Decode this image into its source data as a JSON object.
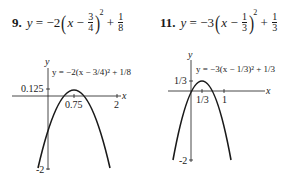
{
  "problems": [
    {
      "number": "9.",
      "equation": {
        "lhs": "y",
        "coef": "−2",
        "var": "x",
        "minus": "−",
        "h_num": "3",
        "h_den": "4",
        "exp": "2",
        "plus": "+",
        "k_num": "1",
        "k_den": "8"
      },
      "graph": {
        "axis_x_label": "x",
        "axis_y_label": "y",
        "curve_label": "y = −2(x − 3/4)² + 1/8",
        "y_tick_top": "0.125",
        "y_tick_bottom": "-2",
        "x_tick_vertex": "0.75",
        "x_tick_right": "2"
      }
    },
    {
      "number": "11.",
      "equation": {
        "lhs": "y",
        "coef": "−3",
        "var": "x",
        "minus": "−",
        "h_num": "1",
        "h_den": "3",
        "exp": "2",
        "plus": "+",
        "k_num": "1",
        "k_den": "3"
      },
      "graph": {
        "axis_x_label": "x",
        "axis_y_label": "y",
        "curve_label": "y = −3(x − 1/3)² + 1/3",
        "y_tick_top": "1/3",
        "y_tick_bottom": "-2",
        "x_tick_vertex": "1/3",
        "x_tick_right": "1"
      }
    }
  ],
  "colors": {
    "ink": "#1a1a1a",
    "background": "#ffffff"
  }
}
